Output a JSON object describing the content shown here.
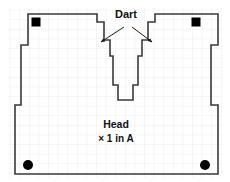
{
  "diagram": {
    "type": "sewing-pattern-piece",
    "labels": {
      "dart": "Dart",
      "piece_name": "Head",
      "quantity": "× 1 in A"
    },
    "colors": {
      "outline": "#3a3a3a",
      "grid": "#e9e9e9",
      "grid_major": "#dedede",
      "marker": "#000000",
      "background": "#ffffff",
      "text": "#111111"
    },
    "grid": {
      "visible": true,
      "spacing_px": 9.6
    },
    "markers": {
      "squares": [
        {
          "name": "top-left-square",
          "cx": 36,
          "cy": 22,
          "size": 9
        },
        {
          "name": "top-right-square",
          "cx": 196,
          "cy": 22,
          "size": 9
        }
      ],
      "circles": [
        {
          "name": "bottom-left-circle",
          "cx": 28,
          "cy": 165,
          "r": 5
        },
        {
          "name": "bottom-right-circle",
          "cx": 205,
          "cy": 165,
          "r": 5
        }
      ]
    },
    "arrows": [
      {
        "name": "dart-arrow-left",
        "x1": 126,
        "y1": 28,
        "x2": 101,
        "y2": 43
      },
      {
        "name": "dart-arrow-right",
        "x1": 130,
        "y1": 28,
        "x2": 152,
        "y2": 43
      }
    ],
    "outline_points": "28,14 97,14 97,22 104,22 104,40 110,40 110,56 113,56 113,85 118,85 118,100 133,100 133,85 138,85 138,56 142,56 142,40 148,40 148,22 155,22 155,14 218,14 218,45 211,45 211,105 218,105 218,174 15,174 15,105 21,105 21,45 28,45"
  }
}
